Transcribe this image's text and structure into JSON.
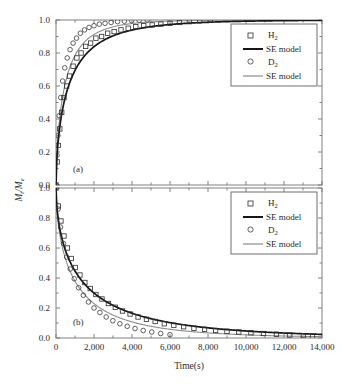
{
  "figure": {
    "ylabel": "M",
    "ylabel_sub1": "t",
    "ylabel_mid": "/M",
    "ylabel_sub2": "e",
    "xlabel": "Time(s)",
    "panel_a_label": "(a)",
    "panel_b_label": "(b)"
  },
  "legend": {
    "entries": [
      {
        "label": "H",
        "sub": "2",
        "marker": "square-marker"
      },
      {
        "label": "SE model",
        "sub": "",
        "marker": "thick-line"
      },
      {
        "label": "D",
        "sub": "2",
        "marker": "circle-marker"
      },
      {
        "label": "SE model",
        "sub": "",
        "marker": "thin-line"
      }
    ]
  },
  "colors": {
    "h2_curve": "#161616",
    "d2_curve": "#8c8c8c",
    "axis": "#808080",
    "text": "#2b2b2b",
    "background": "#ffffff"
  },
  "axes": {
    "x_ticks": [
      "0",
      "2,000",
      "4,000",
      "6,000",
      "8,000",
      "10,000",
      "12,000",
      "14,000"
    ],
    "x_values": [
      0,
      2000,
      4000,
      6000,
      8000,
      10000,
      12000,
      14000
    ],
    "y_ticks": [
      "0.0",
      "0.2",
      "0.4",
      "0.6",
      "0.8",
      "1.0"
    ],
    "y_values": [
      0.0,
      0.2,
      0.4,
      0.6,
      0.8,
      1.0
    ],
    "xlim": [
      0,
      14000
    ],
    "ylim": [
      0,
      1.0
    ]
  },
  "chart_data": {
    "type": "line",
    "title": "",
    "xlabel": "Time(s)",
    "ylabel": "Mt/Me",
    "xlim": [
      0,
      14000
    ],
    "ylim": [
      0,
      1.0
    ],
    "grid": false,
    "legend_position": "upper-right",
    "panels": [
      {
        "id": "a",
        "label": "(a)",
        "description": "Absorption: normalized uptake rising to equilibrium",
        "ylim": [
          0,
          1.0
        ],
        "series": [
          {
            "name": "H2",
            "style": "square-markers",
            "model": "SE model",
            "model_style": "thick-black-line",
            "beta": 0.62,
            "tau": 760,
            "x": [
              0,
              60,
              120,
              200,
              300,
              420,
              560,
              720,
              900,
              1100,
              1320,
              1560,
              1820,
              2100,
              2400,
              2720,
              3060,
              3420,
              3800,
              4200,
              4620,
              5060,
              5520,
              6000,
              6500,
              7020,
              7560,
              8120
            ],
            "y": [
              0.0,
              0.14,
              0.24,
              0.34,
              0.44,
              0.53,
              0.6,
              0.66,
              0.72,
              0.77,
              0.8,
              0.84,
              0.86,
              0.89,
              0.9,
              0.92,
              0.93,
              0.94,
              0.95,
              0.96,
              0.965,
              0.97,
              0.975,
              0.98,
              0.985,
              0.99,
              0.995,
              1.0
            ]
          },
          {
            "name": "D2",
            "style": "circle-markers",
            "model": "SE model",
            "model_style": "thin-gray-line",
            "beta": 0.66,
            "tau": 520,
            "x": [
              0,
              50,
              100,
              170,
              250,
              350,
              460,
              590,
              740,
              900,
              1080,
              1280,
              1500,
              1740,
              2000,
              2280,
              2580,
              2900,
              3240,
              3600,
              3980,
              4380,
              4800
            ],
            "y": [
              0.0,
              0.18,
              0.3,
              0.42,
              0.53,
              0.63,
              0.71,
              0.77,
              0.82,
              0.86,
              0.89,
              0.92,
              0.94,
              0.955,
              0.965,
              0.975,
              0.98,
              0.985,
              0.99,
              0.993,
              0.996,
              0.998,
              1.0
            ]
          }
        ]
      },
      {
        "id": "b",
        "label": "(b)",
        "description": "Desorption: normalized release decaying to zero",
        "ylim": [
          0,
          1.0
        ],
        "series": [
          {
            "name": "H2",
            "style": "square-markers",
            "model": "SE model",
            "model_style": "thick-black-line",
            "beta": 0.58,
            "tau": 1450,
            "x": [
              0,
              120,
              260,
              420,
              600,
              800,
              1020,
              1260,
              1520,
              1800,
              2100,
              2420,
              2760,
              3120,
              3500,
              3900,
              4320,
              4760,
              5220,
              5700,
              6200,
              6720,
              7260,
              7820,
              8400,
              9000,
              9620,
              10260,
              10920,
              11600,
              12300,
              13020,
              13500
            ],
            "y": [
              1.0,
              0.88,
              0.78,
              0.68,
              0.6,
              0.53,
              0.47,
              0.42,
              0.37,
              0.33,
              0.29,
              0.26,
              0.23,
              0.205,
              0.18,
              0.16,
              0.14,
              0.125,
              0.11,
              0.095,
              0.085,
              0.075,
              0.065,
              0.058,
              0.05,
              0.045,
              0.04,
              0.035,
              0.03,
              0.025,
              0.02,
              0.015,
              0.012
            ]
          },
          {
            "name": "D2",
            "style": "circle-markers",
            "model": "SE model",
            "model_style": "thin-gray-line",
            "beta": 0.6,
            "tau": 1050,
            "x": [
              0,
              110,
              240,
              390,
              560,
              750,
              960,
              1190,
              1440,
              1710,
              2000,
              2310,
              2640,
              2990,
              3360,
              3750,
              4160,
              4590,
              5040,
              5510,
              6000
            ],
            "y": [
              1.0,
              0.86,
              0.74,
              0.63,
              0.54,
              0.46,
              0.395,
              0.335,
              0.285,
              0.24,
              0.2,
              0.17,
              0.14,
              0.115,
              0.095,
              0.078,
              0.063,
              0.05,
              0.04,
              0.03,
              0.022
            ]
          }
        ]
      }
    ]
  }
}
